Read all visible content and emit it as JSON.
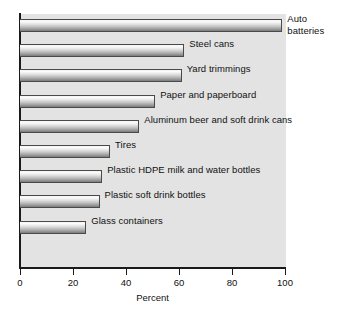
{
  "chart_data": {
    "type": "bar",
    "orientation": "horizontal",
    "title": "",
    "xlabel": "Percent",
    "ylabel": "",
    "xlim": [
      0,
      100
    ],
    "xticks": [
      0,
      20,
      40,
      60,
      80,
      100
    ],
    "grid": false,
    "legend": "none",
    "categories": [
      "Auto batteries",
      "Steel cans",
      "Yard trimmings",
      "Paper and paperboard",
      "Aluminum beer and soft drink cans",
      "Tires",
      "Plastic HDPE milk and water bottles",
      "Plastic soft drink bottles",
      "Glass containers"
    ],
    "values": [
      99,
      62,
      61,
      51,
      45,
      34,
      31,
      30,
      25
    ]
  },
  "bars": [
    {
      "label": "Auto\nbatteries",
      "value": 99
    },
    {
      "label": "Steel cans",
      "value": 62
    },
    {
      "label": "Yard trimmings",
      "value": 61
    },
    {
      "label": "Paper and paperboard",
      "value": 51
    },
    {
      "label": "Aluminum beer and soft drink cans",
      "value": 45
    },
    {
      "label": "Tires",
      "value": 34
    },
    {
      "label": "Plastic HDPE milk and water bottles",
      "value": 31
    },
    {
      "label": "Plastic soft drink bottles",
      "value": 30
    },
    {
      "label": "Glass containers",
      "value": 25
    }
  ],
  "axis": {
    "ticks": [
      "0",
      "20",
      "40",
      "60",
      "80",
      "100"
    ],
    "title": "Percent"
  },
  "colors": {
    "plot_background": "#e3e3e3",
    "axis": "#1a1a1a",
    "bar_border": "#4a4a4a",
    "text": "#111111",
    "page_background": "#ffffff"
  }
}
